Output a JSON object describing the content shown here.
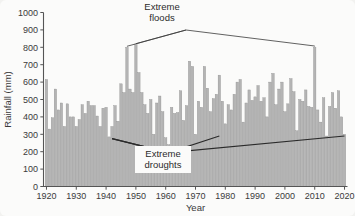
{
  "chart_data": {
    "type": "bar",
    "title": "",
    "xlabel": "Year",
    "ylabel": "Rainfall (mm)",
    "ylim": [
      0,
      1000
    ],
    "xlim": [
      1919,
      2021
    ],
    "ytick_step": 100,
    "yticks": [
      0,
      100,
      200,
      300,
      400,
      500,
      600,
      700,
      800,
      900,
      1000
    ],
    "xticks": [
      1920,
      1930,
      1940,
      1950,
      1960,
      1970,
      1980,
      1990,
      2000,
      2010,
      2020
    ],
    "grid": false,
    "legend": "none",
    "bar_color": "#b4b4b4",
    "bar_edge_color": "#8d8d8d",
    "categories": [
      1920,
      1921,
      1922,
      1923,
      1924,
      1925,
      1926,
      1927,
      1928,
      1929,
      1930,
      1931,
      1932,
      1933,
      1934,
      1935,
      1936,
      1937,
      1938,
      1939,
      1940,
      1941,
      1942,
      1943,
      1944,
      1945,
      1946,
      1947,
      1948,
      1949,
      1950,
      1951,
      1952,
      1953,
      1954,
      1955,
      1956,
      1957,
      1958,
      1959,
      1960,
      1961,
      1962,
      1963,
      1964,
      1965,
      1966,
      1967,
      1968,
      1969,
      1970,
      1971,
      1972,
      1973,
      1974,
      1975,
      1976,
      1977,
      1978,
      1979,
      1980,
      1981,
      1982,
      1983,
      1984,
      1985,
      1986,
      1987,
      1988,
      1989,
      1990,
      1991,
      1992,
      1993,
      1994,
      1995,
      1996,
      1997,
      1998,
      1999,
      2000,
      2001,
      2002,
      2003,
      2004,
      2005,
      2006,
      2007,
      2008,
      2009,
      2010,
      2011,
      2012,
      2013,
      2014,
      2015,
      2016,
      2017,
      2018,
      2019,
      2020
    ],
    "values": [
      615,
      330,
      395,
      560,
      440,
      480,
      345,
      475,
      400,
      400,
      345,
      385,
      470,
      420,
      490,
      465,
      465,
      405,
      345,
      450,
      455,
      285,
      345,
      465,
      375,
      590,
      540,
      800,
      560,
      540,
      815,
      655,
      540,
      470,
      420,
      500,
      300,
      480,
      520,
      430,
      280,
      240,
      455,
      420,
      425,
      550,
      380,
      465,
      720,
      690,
      300,
      490,
      455,
      690,
      565,
      430,
      505,
      530,
      640,
      490,
      360,
      470,
      440,
      530,
      600,
      615,
      370,
      480,
      555,
      495,
      515,
      580,
      490,
      510,
      400,
      600,
      650,
      470,
      560,
      600,
      430,
      475,
      620,
      545,
      320,
      500,
      490,
      555,
      460,
      455,
      800,
      440,
      370,
      510,
      290,
      460,
      540,
      450,
      550,
      400,
      300
    ],
    "annotations": [
      {
        "label": "Extreme floods",
        "lines": [
          "Extreme",
          "floods"
        ],
        "targets": [
          1947,
          1950,
          2010
        ]
      },
      {
        "label": "Extreme droughts",
        "lines": [
          "Extreme",
          "droughts"
        ],
        "targets": [
          1942,
          1961
        ]
      }
    ],
    "trend_lines": [
      {
        "name": "lower-drought-trend",
        "points": [
          [
            1942,
            275
          ],
          [
            1961,
            195
          ],
          [
            2020,
            290
          ]
        ]
      },
      {
        "name": "upper-drought-trend",
        "points": [
          [
            1942,
            275
          ],
          [
            1961,
            195
          ],
          [
            1978,
            290
          ]
        ]
      }
    ]
  }
}
